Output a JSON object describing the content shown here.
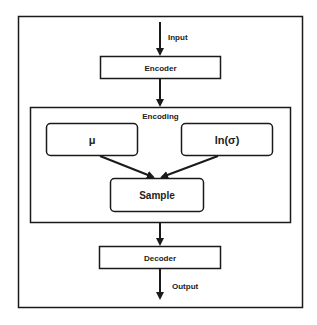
{
  "diagram": {
    "input_label": "Input",
    "encoder_label": "Encoder",
    "encoding_label": "Encoding",
    "mu_label": "μ",
    "log_sigma_label": "ln(σ)",
    "sample_label": "Sample",
    "decoder_label": "Decoder",
    "output_label": "Output"
  },
  "colors": {
    "stroke": "#1a1a1a",
    "background": "#ffffff",
    "text": "#222222"
  }
}
